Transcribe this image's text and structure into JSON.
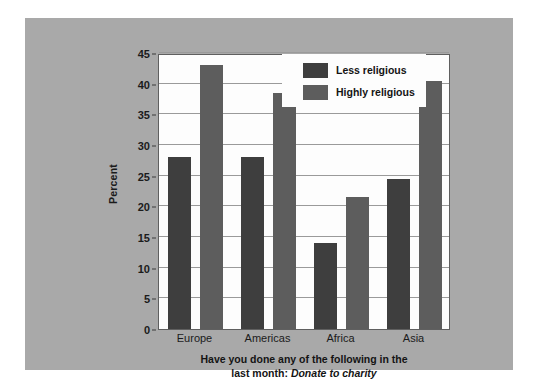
{
  "chart_data": {
    "type": "bar",
    "title": "",
    "subtitle": "",
    "xlabel": "Have you done any of the following in the last month: Donate to charity",
    "xlabel_plain": "Have you done any of the following in the",
    "xlabel_plain2": "last month:",
    "xlabel_italic": "Donate to charity",
    "ylabel": "Percent",
    "ylim": [
      0,
      45
    ],
    "ytick_step": 5,
    "yticks": [
      0,
      5,
      10,
      15,
      20,
      25,
      30,
      35,
      40,
      45
    ],
    "ytick_labels": [
      "0",
      "5",
      "10",
      "15",
      "20",
      "25",
      "30",
      "35",
      "40",
      "45"
    ],
    "categories": [
      "Europe",
      "Americas",
      "Africa",
      "Asia"
    ],
    "grid": true,
    "grid_axis": "y",
    "legend_position": "top-right",
    "series": [
      {
        "name": "Less religious",
        "color": "#3e3e3e",
        "values": [
          28,
          28,
          14,
          24.5
        ]
      },
      {
        "name": "Highly religious",
        "color": "#5d5d5d",
        "values": [
          43,
          38.5,
          21.5,
          40.5
        ]
      }
    ]
  },
  "figure": {
    "background_color": "#ffffff",
    "panel_color": "#a9a9a9",
    "plot_background_color": "#fdfdfd"
  }
}
